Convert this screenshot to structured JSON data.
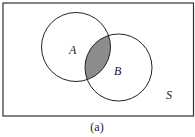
{
  "diagram": {
    "type": "venn",
    "universe_label": "S",
    "sets": [
      {
        "label": "A",
        "cx": 76,
        "cy": 47,
        "r": 34.5
      },
      {
        "label": "B",
        "cx": 118.5,
        "cy": 67.5,
        "r": 33.5
      }
    ],
    "shaded_region": "A ∩ B",
    "shade_color": "#8c8c8c",
    "caption": "(a)"
  },
  "labels": {
    "A": "A",
    "B": "B",
    "S": "S",
    "caption": "(a)"
  }
}
